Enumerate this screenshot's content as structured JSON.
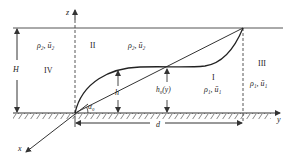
{
  "diagram": {
    "type": "two-layer fluid wedge geometry",
    "axes": {
      "z_label": "z",
      "y_label": "y",
      "x_label": "x"
    },
    "dimensions": {
      "H_label": "H",
      "d_label": "d",
      "h_label": "h",
      "h0_label": "h₀(y)",
      "angle_label": "α₀"
    },
    "regions": [
      {
        "id": "I",
        "label": "I",
        "properties": "ρ₁, ū₁"
      },
      {
        "id": "II",
        "label": "II",
        "properties": "ρ₂, ū₂"
      },
      {
        "id": "III",
        "label": "III",
        "properties": "ρ₁, ū₁"
      },
      {
        "id": "IV",
        "label": "IV",
        "properties": "ρ₂, ū₂"
      }
    ],
    "colors": {
      "line": "#333333",
      "background": "#ffffff"
    }
  }
}
